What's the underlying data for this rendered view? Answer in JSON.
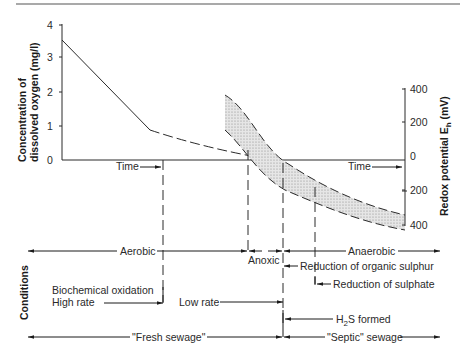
{
  "left_axis": {
    "title_line1": "Concentration of",
    "title_line2": "dissolved oxygen (mg/l)",
    "ticks": [
      "4",
      "3",
      "2",
      "1",
      "0"
    ]
  },
  "right_axis": {
    "title": "Redox potential E",
    "title_sub": "h",
    "title_unit": " (mV)",
    "ticks": [
      "400",
      "200",
      "0",
      "200",
      "400"
    ]
  },
  "time_labels": {
    "left": "Time",
    "right": "Time"
  },
  "conditions": {
    "title": "Conditions",
    "aerobic": "Aerobic",
    "anoxic": "Anoxic",
    "anaerobic": "Anaerobic",
    "reduction_organic_sulphur": "Reduction of organic sulphur",
    "reduction_sulphate": "Reduction of sulphate",
    "biochemical_oxidation": "Biochemical oxidation",
    "high_rate": "High rate",
    "low_rate": "Low rate",
    "h2s_formed_pre": "H",
    "h2s_formed_sub": "2",
    "h2s_formed_post": "S formed",
    "fresh_sewage": "\"Fresh sewage\"",
    "septic_sewage": "\"Septic\" sewage"
  },
  "colors": {
    "line": "#2a2a2a",
    "band_fill": "#d9d9d9",
    "background": "#ffffff"
  }
}
